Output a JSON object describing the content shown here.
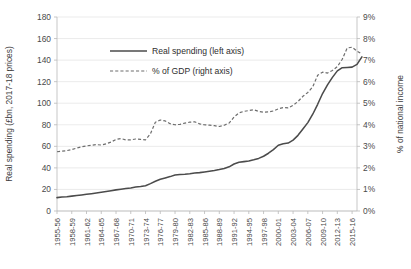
{
  "chart_data": {
    "type": "line",
    "title": "",
    "xlabel": "",
    "ylabel": "Real spending (£bn, 2017-18 prices)",
    "y2label": "% of national income",
    "grid": true,
    "legend_position": "inside-top-left",
    "ylim": [
      0,
      180
    ],
    "yticks": [
      "0",
      "20",
      "40",
      "60",
      "80",
      "100",
      "120",
      "140",
      "160",
      "180"
    ],
    "y2lim": [
      0,
      9
    ],
    "y2ticks": [
      "0%",
      "1%",
      "2%",
      "3%",
      "4%",
      "5%",
      "6%",
      "7%",
      "8%",
      "9%"
    ],
    "x_tick_labels": [
      "1955-56",
      "1958-59",
      "1961-62",
      "1964-65",
      "1967-68",
      "1970-71",
      "1973-74",
      "1976-77",
      "1979-80",
      "1982-83",
      "1985-86",
      "1988-89",
      "1991-92",
      "1994-95",
      "1997-98",
      "2000-01",
      "2003-04",
      "2006-07",
      "2009-10",
      "2012-13",
      "2015-16"
    ],
    "x_all_years": [
      "1955-56",
      "1956-57",
      "1957-58",
      "1958-59",
      "1959-60",
      "1960-61",
      "1961-62",
      "1962-63",
      "1963-64",
      "1964-65",
      "1965-66",
      "1966-67",
      "1967-68",
      "1968-69",
      "1969-70",
      "1970-71",
      "1971-72",
      "1972-73",
      "1973-74",
      "1974-75",
      "1975-76",
      "1976-77",
      "1977-78",
      "1978-79",
      "1979-80",
      "1980-81",
      "1981-82",
      "1982-83",
      "1983-84",
      "1984-85",
      "1985-86",
      "1986-87",
      "1987-88",
      "1988-89",
      "1989-90",
      "1990-91",
      "1991-92",
      "1992-93",
      "1993-94",
      "1994-95",
      "1995-96",
      "1996-97",
      "1997-98",
      "1998-99",
      "1999-00",
      "2000-01",
      "2001-02",
      "2002-03",
      "2003-04",
      "2004-05",
      "2005-06",
      "2006-07",
      "2007-08",
      "2008-09",
      "2009-10",
      "2010-11",
      "2011-12",
      "2012-13",
      "2013-14",
      "2014-15",
      "2015-16",
      "2016-17"
    ],
    "series": [
      {
        "name": "Real spending (left axis)",
        "axis": "left",
        "style": "solid",
        "color": "#4b4b4b",
        "values": [
          12.4,
          12.9,
          13.3,
          13.8,
          14.3,
          14.9,
          15.5,
          16.1,
          16.7,
          17.3,
          18.0,
          18.8,
          19.6,
          20.2,
          20.8,
          21.4,
          22.3,
          22.8,
          23.4,
          25.4,
          27.6,
          29.4,
          30.6,
          31.9,
          33.4,
          33.9,
          34.1,
          34.6,
          35.2,
          35.6,
          36.2,
          36.9,
          37.6,
          38.4,
          39.4,
          41.0,
          43.6,
          45.2,
          45.8,
          46.3,
          47.5,
          48.8,
          50.8,
          53.6,
          57.0,
          61.0,
          62.4,
          63.0,
          65.8,
          70.2,
          76.0,
          82.0,
          89.8,
          99.0,
          109.0,
          117.0,
          124.0,
          130.0,
          133.0,
          133.2,
          133.5,
          136.0,
          143.0
        ]
      },
      {
        "name": "% of GDP (right axis)",
        "axis": "right",
        "style": "dashed",
        "color": "#6d6d6d",
        "values": [
          2.75,
          2.78,
          2.8,
          2.85,
          2.92,
          2.98,
          3.02,
          3.05,
          3.08,
          3.06,
          3.12,
          3.2,
          3.32,
          3.36,
          3.3,
          3.3,
          3.34,
          3.32,
          3.3,
          3.58,
          4.12,
          4.22,
          4.18,
          4.05,
          4.0,
          4.02,
          4.08,
          4.12,
          4.14,
          4.04,
          4.0,
          3.98,
          3.96,
          3.92,
          3.98,
          4.08,
          4.36,
          4.55,
          4.62,
          4.66,
          4.7,
          4.62,
          4.58,
          4.6,
          4.64,
          4.74,
          4.8,
          4.78,
          4.9,
          5.08,
          5.32,
          5.5,
          5.76,
          6.3,
          6.44,
          6.4,
          6.52,
          6.7,
          7.04,
          7.56,
          7.6,
          7.42,
          7.28
        ]
      }
    ]
  },
  "legend": {
    "entries": [
      {
        "label": "Real spending (left axis)"
      },
      {
        "label": "% of GDP (right axis)"
      }
    ]
  }
}
